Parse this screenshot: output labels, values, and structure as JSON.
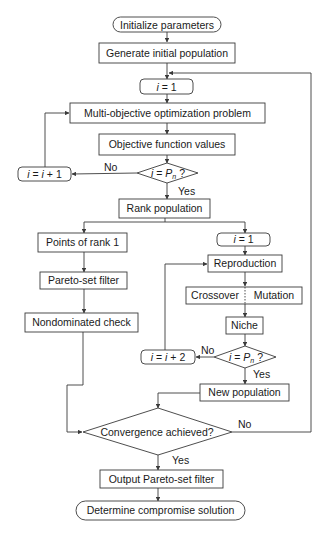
{
  "diagram": {
    "type": "flowchart",
    "title": "",
    "nodes": {
      "init_params": {
        "label": "Initialize parameters",
        "shape": "terminator"
      },
      "gen_pop": {
        "label": "Generate initial population",
        "shape": "process"
      },
      "i_eq_1_top": {
        "label_var": "i",
        "label_rest": " = 1",
        "shape": "rounded"
      },
      "moo_problem": {
        "label": "Multi-objective optimization problem",
        "shape": "process"
      },
      "obj_values": {
        "label": "Objective function values",
        "shape": "process"
      },
      "decision_pn_1": {
        "label_var": "i",
        "label_mid": " = ",
        "label_p": "P",
        "label_sub": "n",
        "label_q": " ?",
        "shape": "decision"
      },
      "i_inc_1": {
        "label_var": "i",
        "label_mid": " = ",
        "label_var2": "i",
        "label_rest": " + 1",
        "shape": "rounded"
      },
      "rank_pop": {
        "label": "Rank population",
        "shape": "process"
      },
      "points_rank1": {
        "label": "Points of rank 1",
        "shape": "process"
      },
      "pareto_filter": {
        "label": "Pareto-set filter",
        "shape": "process"
      },
      "nondominated": {
        "label": "Nondominated check",
        "shape": "process"
      },
      "i_eq_1_right": {
        "label_var": "i",
        "label_rest": " = 1",
        "shape": "rounded"
      },
      "reproduction": {
        "label": "Reproduction",
        "shape": "process"
      },
      "crossover": {
        "label": "Crossover",
        "shape": "process-split-left"
      },
      "mutation": {
        "label": "Mutation",
        "shape": "process-split-right"
      },
      "niche": {
        "label": "Niche",
        "shape": "process"
      },
      "decision_pn_2": {
        "label_var": "i",
        "label_mid": " = ",
        "label_p": "P",
        "label_sub": "n",
        "label_q": " ?",
        "shape": "decision"
      },
      "i_inc_2": {
        "label_var": "i",
        "label_mid": " = ",
        "label_var2": "i",
        "label_rest": " + 2",
        "shape": "rounded"
      },
      "new_pop": {
        "label": "New population",
        "shape": "process"
      },
      "convergence": {
        "label": "Convergence achieved?",
        "shape": "decision"
      },
      "output_pareto": {
        "label": "Output Pareto-set filter",
        "shape": "process"
      },
      "compromise": {
        "label": "Determine compromise solution",
        "shape": "terminator"
      }
    },
    "edge_labels": {
      "no_1": "No",
      "yes_1": "Yes",
      "no_2": "No",
      "yes_2": "Yes",
      "no_conv": "No",
      "yes_conv": "Yes"
    },
    "edges": [
      {
        "from": "init_params",
        "to": "gen_pop"
      },
      {
        "from": "gen_pop",
        "to": "i_eq_1_top"
      },
      {
        "from": "i_eq_1_top",
        "to": "moo_problem"
      },
      {
        "from": "moo_problem",
        "to": "obj_values"
      },
      {
        "from": "obj_values",
        "to": "decision_pn_1"
      },
      {
        "from": "decision_pn_1",
        "to": "i_inc_1",
        "label": "No"
      },
      {
        "from": "i_inc_1",
        "to": "moo_problem"
      },
      {
        "from": "decision_pn_1",
        "to": "rank_pop",
        "label": "Yes"
      },
      {
        "from": "rank_pop",
        "to": "points_rank1"
      },
      {
        "from": "rank_pop",
        "to": "i_eq_1_right"
      },
      {
        "from": "points_rank1",
        "to": "pareto_filter"
      },
      {
        "from": "pareto_filter",
        "to": "nondominated"
      },
      {
        "from": "nondominated",
        "to": "convergence"
      },
      {
        "from": "i_eq_1_right",
        "to": "reproduction"
      },
      {
        "from": "reproduction",
        "to": "niche",
        "via": "crossover | mutation"
      },
      {
        "from": "niche",
        "to": "decision_pn_2"
      },
      {
        "from": "decision_pn_2",
        "to": "i_inc_2",
        "label": "No"
      },
      {
        "from": "i_inc_2",
        "to": "reproduction"
      },
      {
        "from": "decision_pn_2",
        "to": "new_pop",
        "label": "Yes"
      },
      {
        "from": "new_pop",
        "to": "convergence"
      },
      {
        "from": "convergence",
        "to": "i_eq_1_top",
        "label": "No"
      },
      {
        "from": "convergence",
        "to": "output_pareto",
        "label": "Yes"
      },
      {
        "from": "output_pareto",
        "to": "compromise"
      }
    ]
  }
}
